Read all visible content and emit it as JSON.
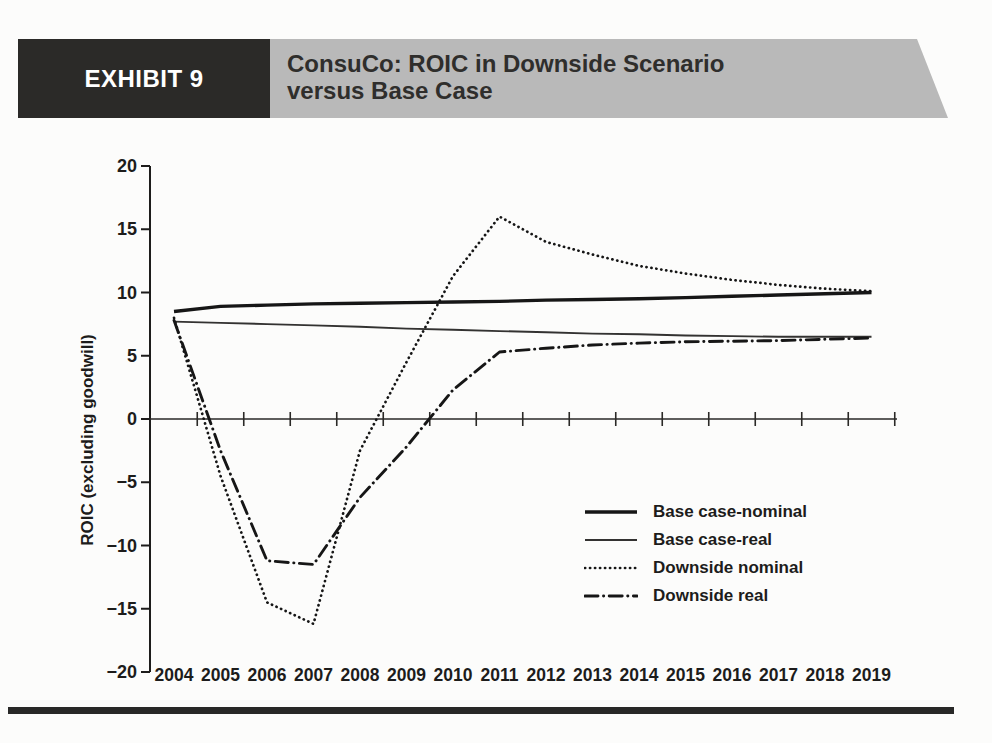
{
  "header": {
    "exhibit_label": "EXHIBIT 9",
    "title_line1": "ConsuCo: ROIC in Downside Scenario",
    "title_line2": "versus Base Case"
  },
  "colors": {
    "banner_black": "#2b2a28",
    "banner_gray": "#b9b9b9",
    "line_color": "#161616",
    "text_color": "#1d1c1b"
  },
  "chart_data": {
    "type": "line",
    "title": "ConsuCo: ROIC in Downside Scenario versus Base Case",
    "ylabel": "ROIC (excluding goodwill)",
    "xlabel": "",
    "ylim": [
      -20,
      20
    ],
    "yticks": [
      20,
      15,
      10,
      5,
      0,
      -5,
      -10,
      -15,
      -20
    ],
    "ytick_labels": [
      "20",
      "15",
      "10",
      "5",
      "0",
      "−5",
      "−10",
      "−15",
      "−20"
    ],
    "categories": [
      "2004",
      "2005",
      "2006",
      "2007",
      "2008",
      "2009",
      "2010",
      "2011",
      "2012",
      "2013",
      "2014",
      "2015",
      "2016",
      "2017",
      "2018",
      "2019"
    ],
    "grid": false,
    "legend_position": "inside-lower-right",
    "series": [
      {
        "name": "Base case-nominal",
        "style": "solid-thick",
        "values": [
          8.5,
          8.9,
          9.0,
          9.1,
          9.15,
          9.2,
          9.25,
          9.3,
          9.4,
          9.45,
          9.5,
          9.6,
          9.7,
          9.8,
          9.9,
          10.0
        ]
      },
      {
        "name": "Base case-real",
        "style": "solid-thin",
        "values": [
          7.7,
          7.6,
          7.5,
          7.4,
          7.3,
          7.15,
          7.05,
          6.95,
          6.85,
          6.75,
          6.7,
          6.6,
          6.55,
          6.5,
          6.5,
          6.5
        ]
      },
      {
        "name": "Downside nominal",
        "style": "dotted",
        "values": [
          8.0,
          -4.5,
          -14.5,
          -16.2,
          -2.5,
          4.5,
          11.3,
          16.0,
          14.0,
          13.0,
          12.1,
          11.5,
          11.0,
          10.6,
          10.3,
          10.1
        ]
      },
      {
        "name": "Downside real",
        "style": "dashdot",
        "values": [
          7.8,
          -2.5,
          -11.2,
          -11.5,
          -6.2,
          -2.2,
          2.3,
          5.3,
          5.6,
          5.85,
          6.0,
          6.1,
          6.15,
          6.2,
          6.3,
          6.4
        ]
      }
    ]
  }
}
